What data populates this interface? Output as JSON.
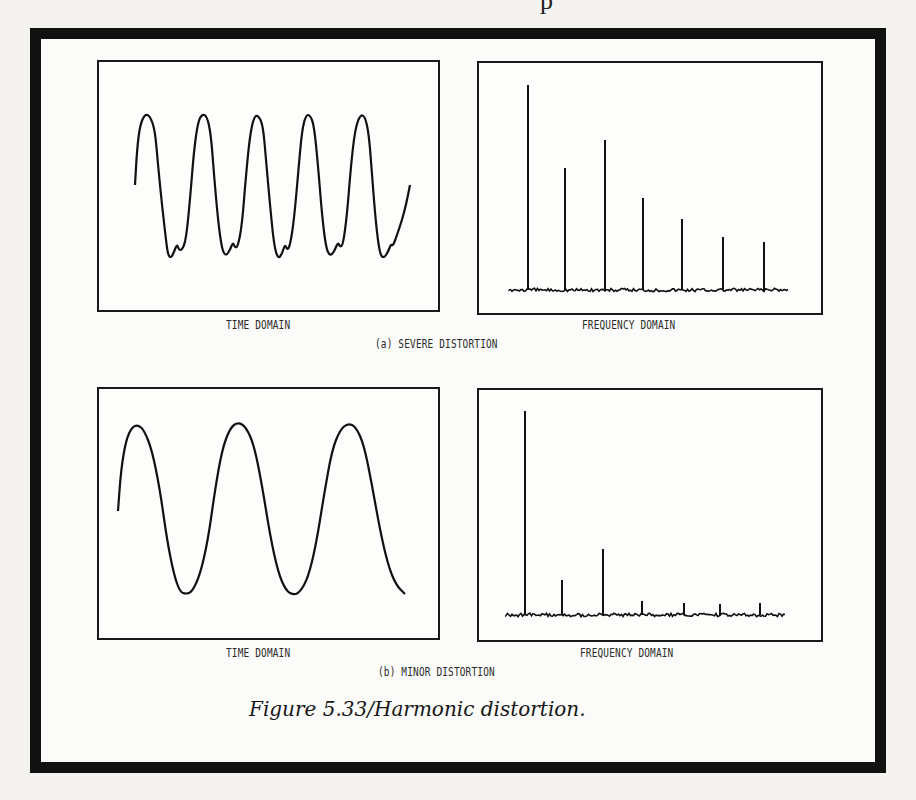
{
  "page_fragment": "p",
  "figure": {
    "caption": "Figure 5.33/Harmonic distortion.",
    "rows": [
      {
        "subcaption": "(a)  SEVERE DISTORTION",
        "time_label": "TIME DOMAIN",
        "freq_label": "FREQUENCY DOMAIN"
      },
      {
        "subcaption": "(b)  MINOR DISTORTION",
        "time_label": "TIME DOMAIN",
        "freq_label": "FREQUENCY DOMAIN"
      }
    ]
  },
  "chart_data": [
    {
      "type": "line",
      "title": "TIME DOMAIN",
      "panel": "(a) SEVERE DISTORTION",
      "description": "Distorted periodic waveform, 5 cycles with flattened troughs and small notches",
      "cycles": 5,
      "grid": false,
      "path_points": [
        [
          135,
          185
        ],
        [
          137,
          150
        ],
        [
          140,
          125
        ],
        [
          145,
          114
        ],
        [
          150,
          116
        ],
        [
          155,
          130
        ],
        [
          158,
          165
        ],
        [
          162,
          205
        ],
        [
          166,
          240
        ],
        [
          168,
          255
        ],
        [
          171,
          258
        ],
        [
          174,
          252
        ],
        [
          177,
          244
        ],
        [
          179,
          250
        ],
        [
          182,
          250
        ],
        [
          186,
          240
        ],
        [
          190,
          200
        ],
        [
          194,
          150
        ],
        [
          198,
          122
        ],
        [
          202,
          114
        ],
        [
          207,
          116
        ],
        [
          211,
          135
        ],
        [
          214,
          175
        ],
        [
          218,
          220
        ],
        [
          222,
          250
        ],
        [
          226,
          256
        ],
        [
          230,
          250
        ],
        [
          233,
          242
        ],
        [
          235,
          248
        ],
        [
          238,
          246
        ],
        [
          242,
          225
        ],
        [
          246,
          175
        ],
        [
          250,
          135
        ],
        [
          254,
          117
        ],
        [
          258,
          115
        ],
        [
          263,
          125
        ],
        [
          266,
          160
        ],
        [
          270,
          205
        ],
        [
          274,
          245
        ],
        [
          278,
          259
        ],
        [
          282,
          254
        ],
        [
          285,
          244
        ],
        [
          287,
          250
        ],
        [
          290,
          246
        ],
        [
          294,
          220
        ],
        [
          298,
          175
        ],
        [
          302,
          130
        ],
        [
          306,
          115
        ],
        [
          310,
          115
        ],
        [
          314,
          125
        ],
        [
          318,
          165
        ],
        [
          322,
          215
        ],
        [
          326,
          248
        ],
        [
          330,
          256
        ],
        [
          334,
          252
        ],
        [
          338,
          242
        ],
        [
          340,
          247
        ],
        [
          343,
          245
        ],
        [
          347,
          215
        ],
        [
          351,
          165
        ],
        [
          355,
          130
        ],
        [
          360,
          115
        ],
        [
          365,
          116
        ],
        [
          369,
          135
        ],
        [
          372,
          175
        ],
        [
          376,
          225
        ],
        [
          380,
          255
        ],
        [
          384,
          258
        ],
        [
          388,
          252
        ],
        [
          391,
          244
        ],
        [
          393,
          246
        ],
        [
          397,
          235
        ],
        [
          402,
          220
        ],
        [
          406,
          205
        ],
        [
          410,
          185
        ]
      ]
    },
    {
      "type": "bar",
      "title": "FREQUENCY DOMAIN",
      "panel": "(a) SEVERE DISTORTION",
      "description": "Fundamental plus strong harmonics above noise floor",
      "categories": [
        "1",
        "2",
        "3",
        "4",
        "5",
        "6",
        "7"
      ],
      "values": [
        100,
        59,
        73,
        44,
        34,
        26,
        23
      ],
      "spike_x_px": [
        528,
        565,
        605,
        643,
        682,
        723,
        764
      ],
      "spike_top_px": [
        85,
        168,
        140,
        198,
        219,
        237,
        242
      ],
      "baseline_px": 290,
      "noise_floor": true,
      "xlabel": "",
      "ylabel": ""
    },
    {
      "type": "line",
      "title": "TIME DOMAIN",
      "panel": "(b) MINOR DISTORTION",
      "description": "Nearly sinusoidal waveform, 3 cycles",
      "cycles": 3,
      "grid": false,
      "path_points": [
        [
          118,
          511
        ],
        [
          121,
          470
        ],
        [
          126,
          440
        ],
        [
          132,
          427
        ],
        [
          138,
          425
        ],
        [
          144,
          430
        ],
        [
          152,
          450
        ],
        [
          160,
          490
        ],
        [
          167,
          540
        ],
        [
          174,
          575
        ],
        [
          180,
          592
        ],
        [
          186,
          594
        ],
        [
          192,
          592
        ],
        [
          200,
          575
        ],
        [
          208,
          540
        ],
        [
          215,
          490
        ],
        [
          222,
          450
        ],
        [
          230,
          428
        ],
        [
          238,
          422
        ],
        [
          246,
          427
        ],
        [
          254,
          445
        ],
        [
          262,
          485
        ],
        [
          270,
          535
        ],
        [
          278,
          572
        ],
        [
          286,
          591
        ],
        [
          294,
          595
        ],
        [
          300,
          592
        ],
        [
          308,
          578
        ],
        [
          316,
          545
        ],
        [
          324,
          495
        ],
        [
          332,
          450
        ],
        [
          340,
          430
        ],
        [
          348,
          423
        ],
        [
          356,
          427
        ],
        [
          364,
          445
        ],
        [
          372,
          485
        ],
        [
          380,
          530
        ],
        [
          388,
          565
        ],
        [
          396,
          585
        ],
        [
          405,
          594
        ]
      ]
    },
    {
      "type": "bar",
      "title": "FREQUENCY DOMAIN",
      "panel": "(b) MINOR DISTORTION",
      "description": "Dominant fundamental with small harmonics",
      "categories": [
        "1",
        "2",
        "3",
        "4",
        "5",
        "6",
        "7"
      ],
      "values": [
        100,
        17,
        33,
        7,
        6,
        5,
        6
      ],
      "spike_x_px": [
        525,
        562,
        603,
        642,
        684,
        720,
        760
      ],
      "spike_top_px": [
        411,
        580,
        549,
        601,
        603,
        604,
        603
      ],
      "baseline_px": 615,
      "noise_floor": true,
      "xlabel": "",
      "ylabel": ""
    }
  ],
  "colors": {
    "ink": "#111111",
    "paper": "#fbfbf9",
    "background": "#f4f3f0"
  }
}
